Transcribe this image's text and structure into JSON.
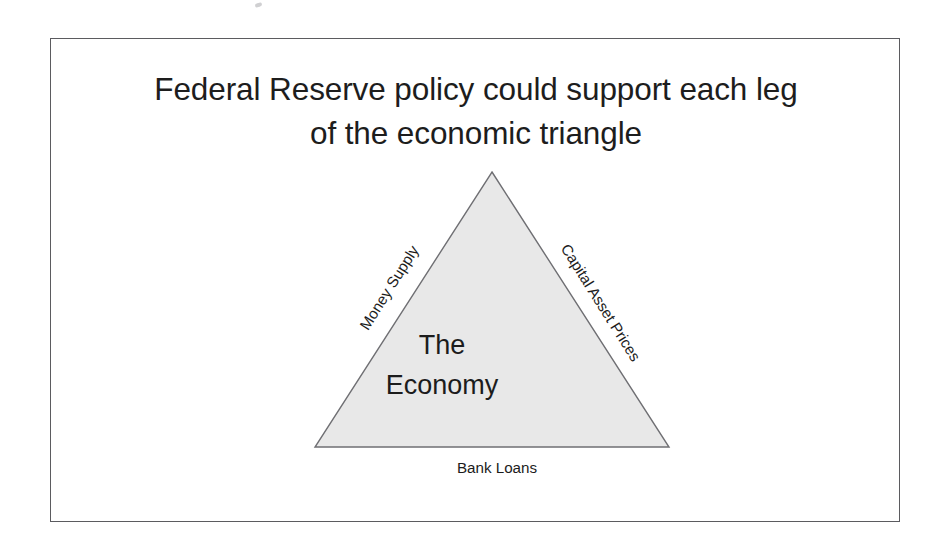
{
  "slide": {
    "title_lines": [
      "Federal Reserve policy could support each leg",
      "of the economic triangle"
    ],
    "frame_color": "#5b5b5f",
    "background_color": "#ffffff",
    "text_color": "#1c1c1c"
  },
  "diagram": {
    "type": "triangle",
    "shape_name": "economic-triangle",
    "fill_color": "#e8e8e8",
    "stroke_color": "#6f6f73",
    "center_label_lines": [
      "The",
      "Economy"
    ],
    "edges": [
      {
        "position": "left",
        "label": "Money Supply",
        "rotation_deg": -57.8
      },
      {
        "position": "right",
        "label": "Capital Asset Prices",
        "rotation_deg": 57.8
      },
      {
        "position": "bottom",
        "label": "Bank Loans",
        "rotation_deg": 0
      }
    ],
    "vertices": {
      "apex": [
        441,
        133
      ],
      "left": [
        264,
        408
      ],
      "right": [
        618,
        408
      ]
    }
  },
  "artifacts": {
    "scan_speck": "scan-speck"
  }
}
